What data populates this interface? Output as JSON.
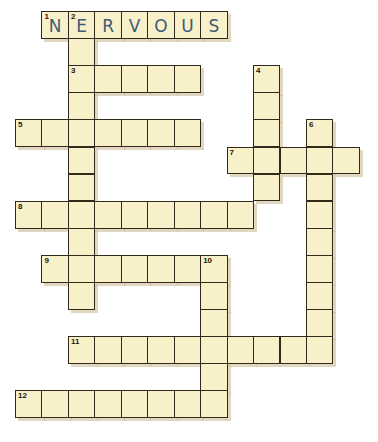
{
  "puzzle": {
    "type": "crossword",
    "cell_width": 26.45,
    "cell_height": 27.1,
    "origin_x": 15,
    "origin_y": 11,
    "colors": {
      "background": "#ffffff",
      "cell_fill": "#f8f0c9",
      "cell_border": "#33291a",
      "filled_letter": "#3e5b78",
      "shadow": "#c8b48a"
    },
    "words": [
      {
        "number": "1",
        "direction": "across",
        "row": 0,
        "col": 1,
        "length": 7,
        "answer": "NERVOUS"
      },
      {
        "number": "2",
        "direction": "down",
        "row": 0,
        "col": 2,
        "length": 11,
        "answer": ""
      },
      {
        "number": "3",
        "direction": "across",
        "row": 2,
        "col": 2,
        "length": 5,
        "answer": ""
      },
      {
        "number": "4",
        "direction": "down",
        "row": 2,
        "col": 9,
        "length": 5,
        "answer": ""
      },
      {
        "number": "5",
        "direction": "across",
        "row": 4,
        "col": 0,
        "length": 7,
        "answer": ""
      },
      {
        "number": "6",
        "direction": "down",
        "row": 4,
        "col": 11,
        "length": 9,
        "answer": ""
      },
      {
        "number": "7",
        "direction": "across",
        "row": 5,
        "col": 8,
        "length": 5,
        "answer": ""
      },
      {
        "number": "8",
        "direction": "across",
        "row": 7,
        "col": 0,
        "length": 9,
        "answer": ""
      },
      {
        "number": "9",
        "direction": "across",
        "row": 9,
        "col": 1,
        "length": 7,
        "answer": ""
      },
      {
        "number": "10",
        "direction": "down",
        "row": 9,
        "col": 7,
        "length": 6,
        "answer": ""
      },
      {
        "number": "11",
        "direction": "across",
        "row": 12,
        "col": 2,
        "length": 10,
        "answer": ""
      },
      {
        "number": "12",
        "direction": "across",
        "row": 14,
        "col": 0,
        "length": 8,
        "answer": ""
      }
    ]
  }
}
